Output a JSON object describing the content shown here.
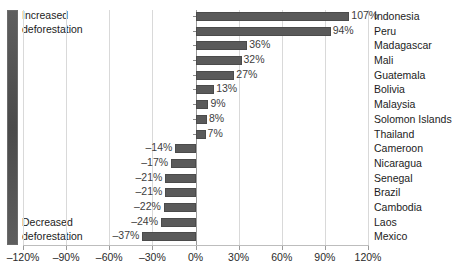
{
  "chart": {
    "type": "bar",
    "orientation": "horizontal",
    "title": "",
    "xlabel": "",
    "ylabel": ""
  },
  "annotations": {
    "top": "Increased\ndeforestation",
    "bottom": "Decreased\ndeforestation"
  },
  "colors": {
    "bar": "#5a5a5a",
    "bar_border": "#4b4b4b",
    "gridline": "#d9d9d9",
    "axis": "#9a9a9a",
    "text": "#1c1c1c",
    "gauge_dark": "#4a4a4a",
    "gauge_light": "#5e5e5e",
    "background": "#ffffff"
  },
  "chart_data": {
    "type": "bar",
    "title": "",
    "xlabel": "",
    "ylabel": "",
    "xlim": [
      -120,
      120
    ],
    "grid": true,
    "legend": false,
    "orientation": "horizontal",
    "unit": "%",
    "xticks": [
      -120,
      -90,
      -60,
      -30,
      0,
      30,
      60,
      90,
      120
    ],
    "xticklabels": [
      "–120%",
      "–90%",
      "–60%",
      "–30%",
      "0%",
      "30%",
      "60%",
      "90%",
      "120%"
    ],
    "categories": [
      "Indonesia",
      "Peru",
      "Madagascar",
      "Mali",
      "Guatemala",
      "Bolivia",
      "Malaysia",
      "Solomon Islands",
      "Thailand",
      "Cameroon",
      "Nicaragua",
      "Senegal",
      "Brazil",
      "Cambodia",
      "Laos",
      "Mexico"
    ],
    "values": [
      107,
      94,
      36,
      32,
      27,
      13,
      9,
      8,
      7,
      -14,
      -17,
      -21,
      -21,
      -22,
      -24,
      -37
    ],
    "value_labels": [
      "107%",
      "94%",
      "36%",
      "32%",
      "27%",
      "13%",
      "9%",
      "8%",
      "7%",
      "–14%",
      "–17%",
      "–21%",
      "–21%",
      "–22%",
      "–24%",
      "–37%"
    ],
    "annotations": [
      "Increased deforestation",
      "Decreased deforestation"
    ]
  }
}
